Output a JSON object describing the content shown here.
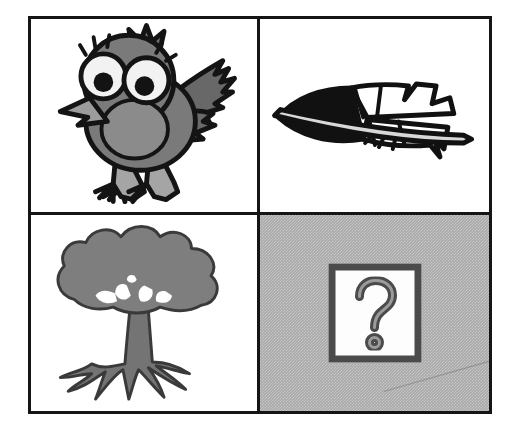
{
  "puzzle": {
    "title": "Visual analogy puzzle",
    "layout": "2x2 grid",
    "relation_label": "bird is to feather as tree is to ?",
    "frame_color": "#151515",
    "unknown_background_color": "#a9a9a9",
    "cells": [
      {
        "position": "top-left",
        "icon_name": "bird-illustration",
        "subject": "bird",
        "description": "Cartoon bird with large eyes, raised wing and two feet",
        "colors": {
          "body": "#7a7a7a",
          "wing": "#6a6a6a",
          "outline": "#141414",
          "eye_white": "#f2f2f2",
          "beak": "#9c9c9c",
          "feet": "#a5a5a5"
        }
      },
      {
        "position": "top-right",
        "icon_name": "feather-illustration",
        "subject": "feather",
        "description": "Single feather pointing left with solid dark tip and quill to the right",
        "colors": {
          "fill_dark": "#111111",
          "fill_light": "#ffffff",
          "outline": "#111111"
        }
      },
      {
        "position": "bottom-left",
        "icon_name": "tree-illustration",
        "subject": "tree",
        "description": "Broad leafy tree with thick trunk and spreading roots",
        "colors": {
          "canopy": "#7e7e7e",
          "trunk": "#747474",
          "outline": "#3a3a3a"
        }
      },
      {
        "position": "bottom-right",
        "icon_name": "question-mark-card",
        "subject": "unknown",
        "description": "Question mark on a white plate over gray halftone background",
        "glyph": "?",
        "colors": {
          "background": "#a9a9a9",
          "plate": "#fdfdfd",
          "plate_border": "#4b4b4b",
          "glyph_outline": "#4b4b4b",
          "glyph_fill": "#9b9b9b"
        }
      }
    ]
  }
}
